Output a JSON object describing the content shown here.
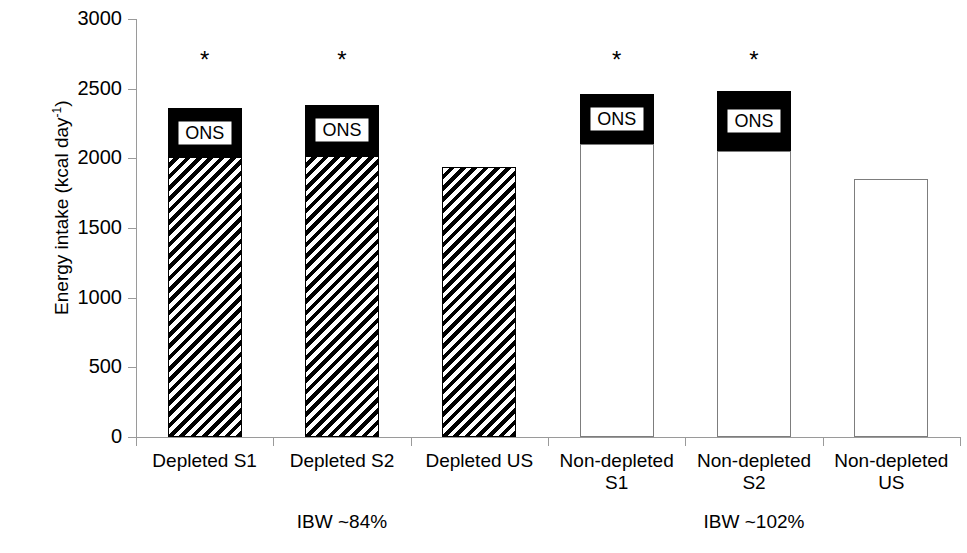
{
  "chart_data": {
    "type": "bar",
    "subtype": "stacked",
    "title": "",
    "xlabel": "",
    "ylabel": "Energy intake (kcal day-1)",
    "ylabel_html": "Energy intake (kcal day<sup>-1</sup>)",
    "ylim": [
      0,
      3000
    ],
    "yticks": [
      0,
      500,
      1000,
      1500,
      2000,
      2500,
      3000
    ],
    "ytick_labels": [
      "0",
      "500",
      "1000",
      "1500",
      "2000",
      "2500",
      "3000"
    ],
    "grid": false,
    "legend_position": "in-bar",
    "categories": [
      "Depleted S1",
      "Depleted S2",
      "Depleted US",
      "Non-depleted S1",
      "Non-depleted S2",
      "Non-depleted US"
    ],
    "category_lines": [
      [
        "Depleted S1"
      ],
      [
        "Depleted S2"
      ],
      [
        "Depleted US"
      ],
      [
        "Non-depleted",
        "S1"
      ],
      [
        "Non-depleted",
        "S2"
      ],
      [
        "Non-depleted",
        "US"
      ]
    ],
    "series": [
      {
        "name": "Food",
        "values": [
          2010,
          2020,
          1940,
          2100,
          2050,
          1850
        ]
      },
      {
        "name": "ONS",
        "values": [
          350,
          360,
          0,
          360,
          430,
          0
        ]
      }
    ],
    "totals": [
      2360,
      2380,
      1940,
      2460,
      2480,
      1850
    ],
    "bar_style": [
      "hatched",
      "hatched",
      "hatched",
      "plain",
      "plain",
      "plain"
    ],
    "ons_label": "ONS",
    "ons_label_visible": [
      true,
      true,
      false,
      true,
      true,
      false
    ],
    "significance_marker": "*",
    "significance": [
      true,
      true,
      false,
      true,
      true,
      false
    ],
    "groups": [
      {
        "label": "IBW ~84%",
        "categories": [
          0,
          1,
          2
        ]
      },
      {
        "label": "IBW ~102%",
        "categories": [
          3,
          4,
          5
        ]
      }
    ],
    "colors": {
      "ons_fill": "#000000",
      "bar_outline": "#000000",
      "plain_bar_fill": "#ffffff",
      "axis": "#9a9a9a",
      "text": "#000000",
      "background": "#ffffff"
    }
  }
}
